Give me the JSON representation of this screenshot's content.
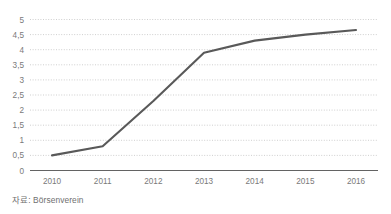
{
  "chart_data": {
    "type": "line",
    "title": "",
    "subtitle": "",
    "xlabel": "",
    "ylabel": "",
    "categories": [
      "2010",
      "2011",
      "2012",
      "2013",
      "2014",
      "2015",
      "2016"
    ],
    "x": [
      2010,
      2011,
      2012,
      2013,
      2014,
      2015,
      2016
    ],
    "values": [
      0.5,
      0.8,
      2.3,
      3.9,
      4.3,
      4.5,
      4.65
    ],
    "series": [
      {
        "name": "",
        "values": [
          0.5,
          0.8,
          2.3,
          3.9,
          4.3,
          4.5,
          4.65
        ]
      }
    ],
    "ylim": [
      0,
      5
    ],
    "ytick_values": [
      0,
      0.5,
      1,
      1.5,
      2,
      2.5,
      3,
      3.5,
      4,
      4.5,
      5
    ],
    "ytick_labels": [
      "0",
      "0,5",
      "1",
      "1,5",
      "2",
      "2,5",
      "3",
      "3,5",
      "4",
      "4,5",
      "5"
    ],
    "xtick_labels": [
      "2010",
      "2011",
      "2012",
      "2013",
      "2014",
      "2015",
      "2016"
    ],
    "grid": true,
    "grid_style": "dotted-horizontal",
    "legend": false,
    "legend_position": "none",
    "line_color": "#595959",
    "grid_color": "#c9c9c9",
    "axis_color": "#636363",
    "tick_label_color": "#7a7a7a",
    "background_color": "#ffffff"
  },
  "footer": {
    "source_label": "자료: Börsenverein"
  }
}
